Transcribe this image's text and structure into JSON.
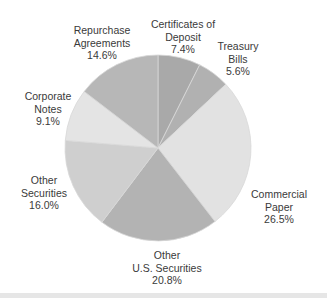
{
  "chart_data": {
    "type": "pie",
    "title": "",
    "start_angle_deg": 0,
    "direction": "clockwise",
    "center": [
      158,
      148
    ],
    "radius": 93,
    "slices": [
      {
        "label_lines": [
          "Certificates of",
          "Deposit"
        ],
        "label": "Certificates of Deposit",
        "value": 7.4,
        "value_text": "7.4%",
        "color": "#a9a9a9",
        "label_pos": [
          183,
          18
        ]
      },
      {
        "label_lines": [
          "Treasury",
          "Bills"
        ],
        "label": "Treasury Bills",
        "value": 5.6,
        "value_text": "5.6%",
        "color": "#b1b1b1",
        "label_pos": [
          238,
          40
        ]
      },
      {
        "label_lines": [
          "Commercial",
          "Paper"
        ],
        "label": "Commercial Paper",
        "value": 26.5,
        "value_text": "26.5%",
        "color": "#e2e2e2",
        "label_pos": [
          279,
          188
        ]
      },
      {
        "label_lines": [
          "Other",
          "U.S. Securities"
        ],
        "label": "Other U.S. Securities",
        "value": 20.8,
        "value_text": "20.8%",
        "color": "#b3b3b3",
        "label_pos": [
          167,
          249
        ]
      },
      {
        "label_lines": [
          "Other",
          "Securities"
        ],
        "label": "Other Securities",
        "value": 16.0,
        "value_text": "16.0%",
        "color": "#cfcfcf",
        "label_pos": [
          44,
          174
        ]
      },
      {
        "label_lines": [
          "Corporate",
          "Notes"
        ],
        "label": "Corporate Notes",
        "value": 9.1,
        "value_text": "9.1%",
        "color": "#e4e4e4",
        "label_pos": [
          48,
          90
        ]
      },
      {
        "label_lines": [
          "Repurchase",
          "Agreements"
        ],
        "label": "Repurchase Agreements",
        "value": 14.6,
        "value_text": "14.6%",
        "color": "#b7b7b7",
        "label_pos": [
          102,
          24
        ]
      }
    ],
    "legend": "none (direct labels)",
    "separator_color": "#d8d8d8"
  }
}
